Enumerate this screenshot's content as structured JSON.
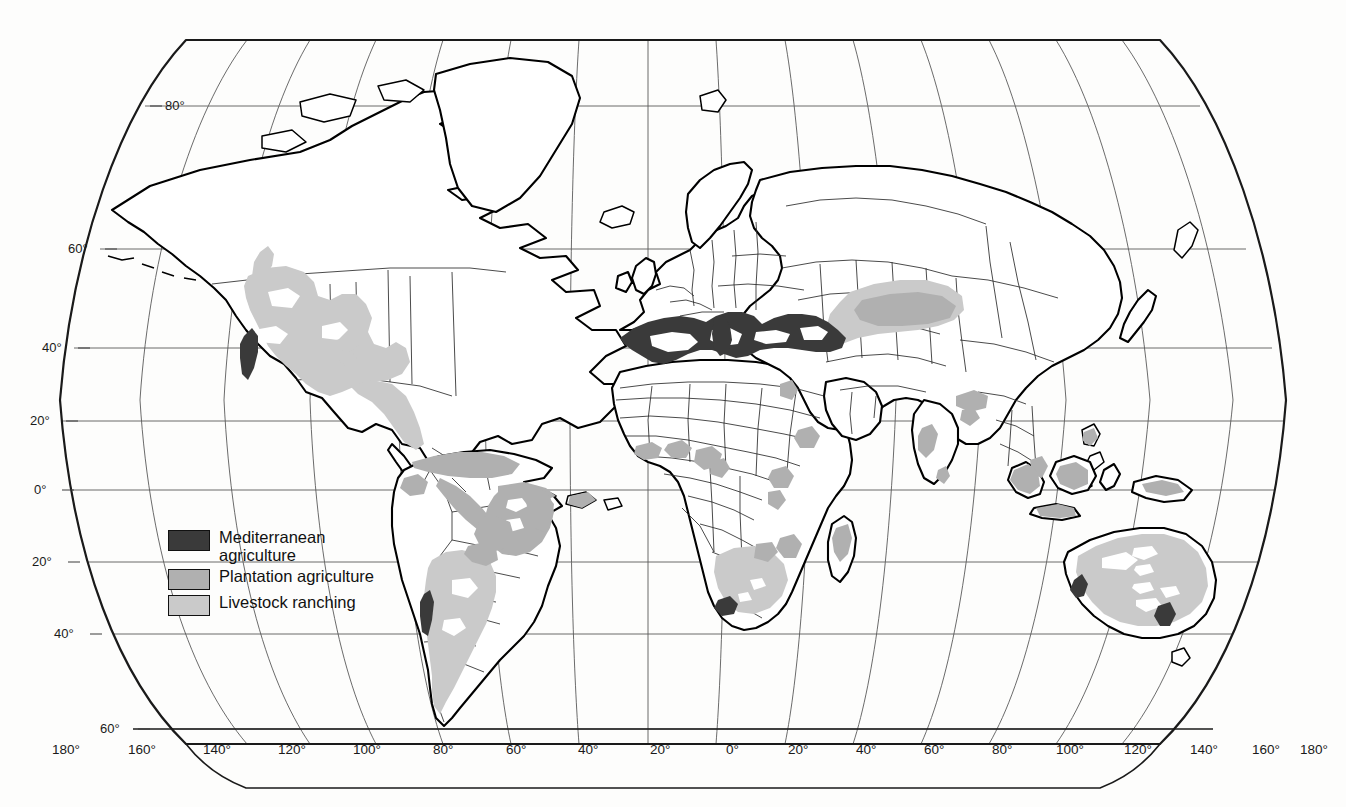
{
  "map": {
    "title": "World map of agricultural regions",
    "projection": "robinson-like pseudocylindrical",
    "background_color": "#fdfdfc",
    "coastline_color": "#000000",
    "border_color": "#2b2b2b",
    "graticule_color": "#5a5a5a"
  },
  "legend": {
    "name": "map-legend",
    "items": [
      {
        "id": "mediterranean-agriculture",
        "label": "Mediterranean\nagriculture",
        "color": "#3a3a3a",
        "swatch_name": "mediterranean-agriculture-swatch"
      },
      {
        "id": "plantation-agriculture",
        "label": "Plantation agriculture",
        "color": "#b0b0b0",
        "swatch_name": "plantation-agriculture-swatch"
      },
      {
        "id": "livestock-ranching",
        "label": "Livestock ranching",
        "color": "#cacaca",
        "swatch_name": "livestock-ranching-swatch"
      }
    ]
  },
  "graticule": {
    "latitude_labels": [
      {
        "text": "80°",
        "value": 80
      },
      {
        "text": "60°",
        "value": 60
      },
      {
        "text": "40°",
        "value": 40
      },
      {
        "text": "20°",
        "value": 20
      },
      {
        "text": "0°",
        "value": 0
      },
      {
        "text": "20°",
        "value": -20
      },
      {
        "text": "40°",
        "value": -40
      },
      {
        "text": "60°",
        "value": -60
      }
    ],
    "longitude_labels": [
      {
        "text": "180°",
        "value": -180
      },
      {
        "text": "160°",
        "value": -160
      },
      {
        "text": "140°",
        "value": -140
      },
      {
        "text": "120°",
        "value": -120
      },
      {
        "text": "100°",
        "value": -100
      },
      {
        "text": "80°",
        "value": -80
      },
      {
        "text": "60°",
        "value": -60
      },
      {
        "text": "40°",
        "value": -40
      },
      {
        "text": "20°",
        "value": -20
      },
      {
        "text": "0°",
        "value": 0
      },
      {
        "text": "20°",
        "value": 20
      },
      {
        "text": "40°",
        "value": 40
      },
      {
        "text": "60°",
        "value": 60
      },
      {
        "text": "80°",
        "value": 80
      },
      {
        "text": "100°",
        "value": 100
      },
      {
        "text": "120°",
        "value": 120
      },
      {
        "text": "140°",
        "value": 140
      },
      {
        "text": "160°",
        "value": 160
      },
      {
        "text": "180°",
        "value": 180
      }
    ]
  }
}
